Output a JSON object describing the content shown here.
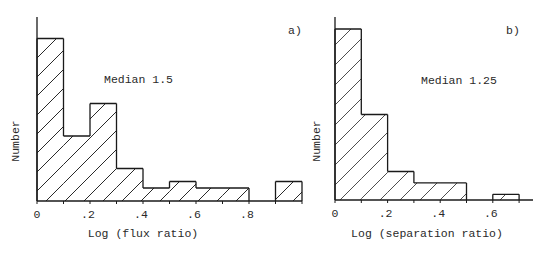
{
  "chart_data": [
    {
      "type": "bar",
      "panel_label": "a)",
      "annotation": "Median 1.5",
      "title": "",
      "xlabel": "Log (flux ratio)",
      "ylabel": "Number",
      "bin_edges": [
        0,
        0.1,
        0.2,
        0.3,
        0.4,
        0.5,
        0.6,
        0.7,
        0.8,
        0.9,
        1.0
      ],
      "categories": [
        "0-0.1",
        "0.1-0.2",
        "0.2-0.3",
        "0.3-0.4",
        "0.4-0.5",
        "0.5-0.6",
        "0.6-0.7",
        "0.7-0.8",
        "0.8-0.9",
        "0.9-1.0"
      ],
      "values": [
        25,
        10,
        15,
        5,
        2,
        3,
        2,
        2,
        0,
        3
      ],
      "xticks": [
        "0",
        ".2",
        ".4",
        ".6",
        ".8"
      ],
      "xtick_values": [
        0,
        0.2,
        0.4,
        0.6,
        0.8
      ],
      "xlim": [
        0,
        1.0
      ],
      "ylim": [
        0,
        28
      ],
      "grid": false,
      "hatch": "diagonal",
      "geom": {
        "x0": 37,
        "base": 201,
        "px_per_unit_x": 265,
        "px_per_unit_y": 6.5,
        "axis_top": 17,
        "axis_right": 302
      }
    },
    {
      "type": "bar",
      "panel_label": "b)",
      "annotation": "Median 1.25",
      "title": "",
      "xlabel": "Log (separation ratio)",
      "ylabel": "Number",
      "bin_edges": [
        0,
        0.1,
        0.2,
        0.3,
        0.4,
        0.5,
        0.6,
        0.7
      ],
      "categories": [
        "0-0.1",
        "0.1-0.2",
        "0.2-0.3",
        "0.3-0.4",
        "0.4-0.5",
        "0.5-0.6",
        "0.6-0.7"
      ],
      "values": [
        30,
        15,
        5,
        3,
        3,
        0,
        1
      ],
      "xticks": [
        "0",
        ".2",
        ".4",
        ".6"
      ],
      "xtick_values": [
        0,
        0.2,
        0.4,
        0.6
      ],
      "xlim": [
        0,
        0.75
      ],
      "ylim": [
        0,
        32
      ],
      "grid": false,
      "hatch": "diagonal",
      "geom": {
        "x0": 335,
        "base": 200,
        "px_per_unit_x": 263,
        "px_per_unit_y": 5.7,
        "axis_top": 17,
        "axis_right": 533
      }
    }
  ]
}
